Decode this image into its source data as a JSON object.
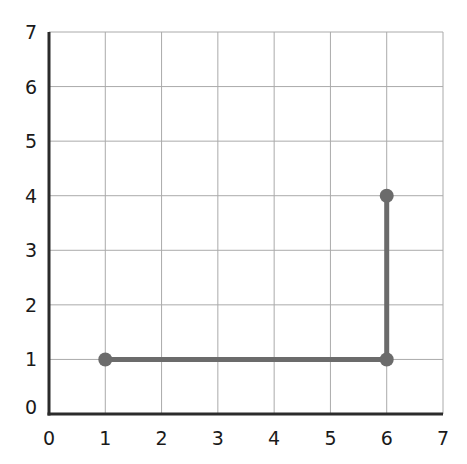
{
  "chart_data": {
    "type": "line",
    "title": "",
    "xlabel": "",
    "ylabel": "",
    "xlim": [
      0,
      7
    ],
    "ylim": [
      0,
      7
    ],
    "grid": true,
    "x_ticks": [
      "0",
      "1",
      "2",
      "3",
      "4",
      "5",
      "6",
      "7"
    ],
    "y_ticks": [
      "0",
      "1",
      "2",
      "3",
      "4",
      "5",
      "6",
      "7"
    ],
    "series": [
      {
        "name": "path",
        "points": [
          {
            "x": 1,
            "y": 1
          },
          {
            "x": 6,
            "y": 1
          },
          {
            "x": 6,
            "y": 4
          }
        ]
      }
    ]
  },
  "colors": {
    "line": "#6b6b6b",
    "marker": "#6b6b6b",
    "grid": "#aaaaaa",
    "axis": "#2b2b2b"
  }
}
